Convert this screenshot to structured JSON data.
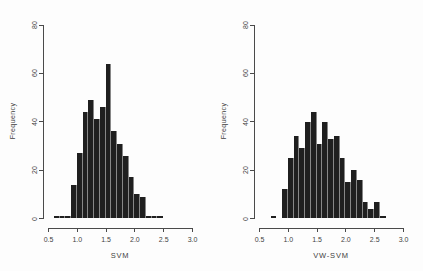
{
  "colors": {
    "background": "#fdfdfd",
    "axis": "#4a4a4a",
    "text": "#3f3f3f",
    "bar": "#1f1f1f",
    "bar_separator": "#878787"
  },
  "chart_data": [
    {
      "type": "bar",
      "variant": "histogram",
      "title": "",
      "xlabel": "SVM",
      "ylabel": "Frequency",
      "xlim": [
        0.5,
        3.0
      ],
      "ylim": [
        0,
        80
      ],
      "x_ticks": [
        0.5,
        1.0,
        1.5,
        2.0,
        2.5,
        3.0
      ],
      "x_tick_labels": [
        "0.5",
        "1.0",
        "1.5",
        "2.0",
        "2.5",
        "3.0"
      ],
      "y_ticks": [
        0,
        20,
        40,
        60,
        80
      ],
      "y_tick_labels": [
        "0",
        "20",
        "40",
        "60",
        "80"
      ],
      "grid": false,
      "legend": null,
      "bin_start": 0.6,
      "bin_width": 0.1,
      "counts": [
        1,
        1,
        1,
        14,
        27,
        44,
        49,
        41,
        46,
        64,
        36,
        31,
        26,
        17,
        10,
        9,
        1,
        1,
        1
      ]
    },
    {
      "type": "bar",
      "variant": "histogram",
      "title": "",
      "xlabel": "VW-SVM",
      "ylabel": "Frequency",
      "xlim": [
        0.5,
        3.0
      ],
      "ylim": [
        0,
        80
      ],
      "x_ticks": [
        0.5,
        1.0,
        1.5,
        2.0,
        2.5,
        3.0
      ],
      "x_tick_labels": [
        "0.5",
        "1.0",
        "1.5",
        "2.0",
        "2.5",
        "3.0"
      ],
      "y_ticks": [
        0,
        20,
        40,
        60,
        80
      ],
      "y_tick_labels": [
        "0",
        "20",
        "40",
        "60",
        "80"
      ],
      "grid": false,
      "legend": null,
      "bin_start": 0.7,
      "bin_width": 0.1,
      "counts": [
        1,
        0,
        12,
        25,
        34,
        29,
        40,
        44,
        31,
        40,
        33,
        34,
        25,
        15,
        20,
        16,
        7,
        4,
        7,
        1
      ]
    }
  ]
}
